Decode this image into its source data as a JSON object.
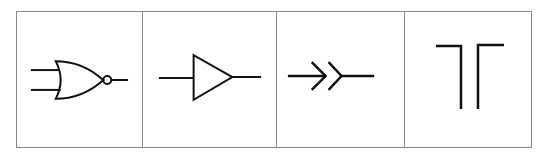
{
  "diagram": {
    "type": "circuit-symbol-table",
    "stroke_color": "#111111",
    "border_color": "#8a8a8a",
    "cells": [
      {
        "symbol": "nor-gate",
        "label": "NOR gate",
        "inputs": 2,
        "outputs": 1,
        "inverted_output": true
      },
      {
        "symbol": "buffer",
        "label": "Buffer / amplifier",
        "inputs": 1,
        "outputs": 1
      },
      {
        "symbol": "connector",
        "label": "Plug and socket connector",
        "inputs": 1,
        "outputs": 1
      },
      {
        "symbol": "switch-contacts",
        "label": "Contacts (T)",
        "terminals": 2
      }
    ]
  }
}
